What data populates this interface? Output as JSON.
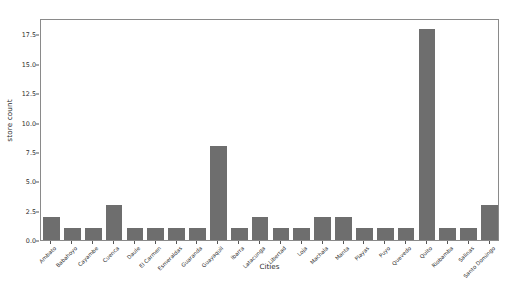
{
  "chart_data": {
    "type": "bar",
    "title": "",
    "xlabel": "Cities",
    "ylabel": "store count",
    "ylim": [
      0,
      18.9
    ],
    "yticks": [
      0.0,
      2.5,
      5.0,
      7.5,
      10.0,
      12.5,
      15.0,
      17.5
    ],
    "ytick_labels": [
      "0.0",
      "2.5",
      "5.0",
      "7.5",
      "10.0",
      "12.5",
      "15.0",
      "17.5"
    ],
    "grid": false,
    "legend": null,
    "bar_color": "#6e6e6e",
    "axes_color": "#8a8a8a",
    "categories": [
      "Ambato",
      "Babahoyo",
      "Cayambe",
      "Cuenca",
      "Daule",
      "El Carmen",
      "Esmeraldas",
      "Guaranda",
      "Guayaquil",
      "Ibarra",
      "Latacunga",
      "Libertad",
      "Loja",
      "Machala",
      "Manta",
      "Playas",
      "Puyo",
      "Quevedo",
      "Quito",
      "Riobamba",
      "Salinas",
      "Santo Domingo"
    ],
    "values": [
      2,
      1,
      1,
      3,
      1,
      1,
      1,
      1,
      8,
      1,
      2,
      1,
      1,
      2,
      2,
      1,
      1,
      1,
      18,
      1,
      1,
      3
    ]
  }
}
